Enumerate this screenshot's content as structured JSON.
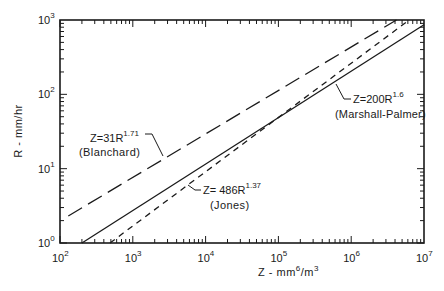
{
  "chart_data": {
    "type": "line",
    "title": "",
    "xlabel": "Z - mm6/m3",
    "ylabel": "R - mm/hr",
    "xscale": "log",
    "yscale": "log",
    "xlim": [
      100,
      10000000
    ],
    "ylim": [
      1,
      1000
    ],
    "grid": false,
    "x_ticks": [
      {
        "value": 100,
        "base": "10",
        "exp": "2"
      },
      {
        "value": 1000,
        "base": "10",
        "exp": "3"
      },
      {
        "value": 10000,
        "base": "10",
        "exp": "4"
      },
      {
        "value": 100000,
        "base": "10",
        "exp": "5"
      },
      {
        "value": 1000000,
        "base": "10",
        "exp": "6"
      },
      {
        "value": 10000000,
        "base": "10",
        "exp": "7"
      }
    ],
    "y_ticks": [
      {
        "value": 1,
        "base": "10",
        "exp": "0"
      },
      {
        "value": 10,
        "base": "10",
        "exp": "1"
      },
      {
        "value": 100,
        "base": "10",
        "exp": "2"
      },
      {
        "value": 1000,
        "base": "10",
        "exp": "3"
      }
    ],
    "series": [
      {
        "name": "Blanchard",
        "equation": "Z=31R^1.71",
        "a": 31,
        "b": 1.71,
        "style": "long-dash",
        "z_start": 130,
        "label_main": "Z=31R",
        "label_exp": "1.71",
        "label_sub": "(Blanchard)",
        "points": [
          [
            130,
            2.2
          ],
          [
            1000,
            7.6
          ],
          [
            10000,
            29
          ],
          [
            100000,
            111
          ],
          [
            1000000,
            425
          ],
          [
            4200000,
            1000
          ]
        ]
      },
      {
        "name": "Marshall-Palmer",
        "equation": "Z=200R^1.6",
        "a": 200,
        "b": 1.6,
        "style": "solid",
        "z_start": 200,
        "label_main": "Z=200R",
        "label_exp": "1.6",
        "label_sub": "(Marshall-Palmer)",
        "points": [
          [
            200,
            1
          ],
          [
            1000,
            2.7
          ],
          [
            10000,
            11.5
          ],
          [
            100000,
            48.6
          ],
          [
            1000000,
            205
          ],
          [
            10000000,
            865
          ]
        ]
      },
      {
        "name": "Jones",
        "equation": "Z=486R^1.37",
        "a": 486,
        "b": 1.37,
        "style": "short-dash",
        "z_start": 486,
        "label_main": "Z= 486R",
        "label_exp": "1.37",
        "label_sub": "(Jones)",
        "points": [
          [
            486,
            1
          ],
          [
            1000,
            1.69
          ],
          [
            10000,
            9.1
          ],
          [
            100000,
            48.5
          ],
          [
            1000000,
            260
          ],
          [
            6200000,
            1000
          ]
        ]
      }
    ]
  }
}
